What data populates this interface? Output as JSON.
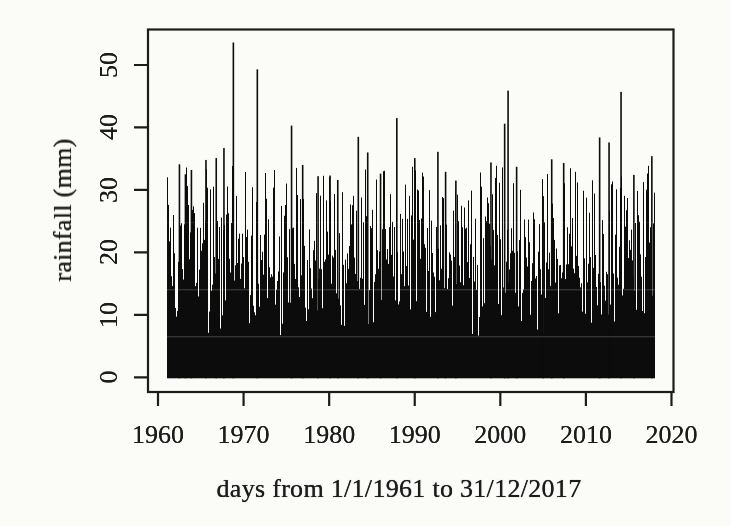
{
  "page": {
    "background": "#fbfbf8",
    "ink": "#1c1c1c",
    "bar_color": "#0c0c0c"
  },
  "chart_data": {
    "type": "bar",
    "variant": "high-density daily spike plot (R type='h'), scanned monochrome figure",
    "title": "",
    "xlabel": "days from 1/1/1961 to 31/12/2017",
    "ylabel": "rainfall (mm)",
    "x_ticks": [
      1960,
      1970,
      1980,
      1990,
      2000,
      2010,
      2020
    ],
    "y_ticks": [
      0,
      10,
      20,
      30,
      40,
      50
    ],
    "xlim": [
      1958.8,
      2020.2
    ],
    "ylim": [
      -2.3,
      55.8
    ],
    "grid": false,
    "legend": null,
    "series_name": "daily rainfall (mm)",
    "data_start": "1/1/1961",
    "data_end": "31/12/2017",
    "max_value_mm": 53.6,
    "notable_peaks": [
      {
        "year": 1962.5,
        "mm": 34.1
      },
      {
        "year": 1963.2,
        "mm": 32.5
      },
      {
        "year": 1963.9,
        "mm": 33.2
      },
      {
        "year": 1965.6,
        "mm": 34.8
      },
      {
        "year": 1966.8,
        "mm": 35.1
      },
      {
        "year": 1967.7,
        "mm": 36.7
      },
      {
        "year": 1968.8,
        "mm": 53.6
      },
      {
        "year": 1971.6,
        "mm": 49.3
      },
      {
        "year": 1975.6,
        "mm": 40.3
      },
      {
        "year": 1976.9,
        "mm": 34.0
      },
      {
        "year": 1978.7,
        "mm": 32.2
      },
      {
        "year": 1980.1,
        "mm": 32.3
      },
      {
        "year": 1981.0,
        "mm": 31.6
      },
      {
        "year": 1983.4,
        "mm": 38.5
      },
      {
        "year": 1984.5,
        "mm": 36.0
      },
      {
        "year": 1986.0,
        "mm": 32.6
      },
      {
        "year": 1987.9,
        "mm": 41.5
      },
      {
        "year": 1990.0,
        "mm": 35.1
      },
      {
        "year": 1992.7,
        "mm": 36.1
      },
      {
        "year": 1993.6,
        "mm": 32.9
      },
      {
        "year": 1994.8,
        "mm": 31.5
      },
      {
        "year": 1998.9,
        "mm": 34.4
      },
      {
        "year": 2000.5,
        "mm": 40.6
      },
      {
        "year": 2000.9,
        "mm": 45.9
      },
      {
        "year": 2001.9,
        "mm": 33.7
      },
      {
        "year": 2005.0,
        "mm": 29.0
      },
      {
        "year": 2006.0,
        "mm": 34.9
      },
      {
        "year": 2007.4,
        "mm": 34.3
      },
      {
        "year": 2011.6,
        "mm": 38.4
      },
      {
        "year": 2012.7,
        "mm": 37.6
      },
      {
        "year": 2014.1,
        "mm": 45.7
      },
      {
        "year": 2015.6,
        "mm": 32.4
      },
      {
        "year": 2017.7,
        "mm": 35.4
      }
    ],
    "dense_background": {
      "description": "about 20,800 daily values; mass is solid black below about 7 mm, mostly solid to about 14 mm; typical daily column tops 14-26 mm with occasional white gaps dipping to 7-10 mm",
      "floor_mm": 6.5,
      "typical_top_range_mm": [
        14,
        26
      ],
      "gap_share": 0.18
    }
  }
}
